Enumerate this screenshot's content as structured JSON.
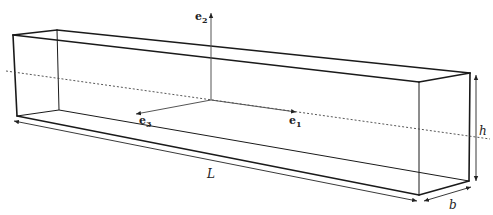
{
  "figure": {
    "basis_vectors": [
      {
        "symbol": "e",
        "subscript": "1",
        "direction": "along beam axis"
      },
      {
        "symbol": "e",
        "subscript": "2",
        "direction": "vertical"
      },
      {
        "symbol": "e",
        "subscript": "3",
        "direction": "transverse"
      }
    ],
    "dimensions": {
      "length": "L",
      "height": "h",
      "width": "b"
    },
    "labels": {
      "e1_base": "e",
      "e1_sub": "1",
      "e2_base": "e",
      "e2_sub": "2",
      "e3_base": "e",
      "e3_sub": "3",
      "L": "L",
      "h": "h",
      "b": "b"
    },
    "colors": {
      "edge": "#1a1a1a",
      "axis": "#555555",
      "centerline": "#444444",
      "background": "#ffffff"
    }
  }
}
